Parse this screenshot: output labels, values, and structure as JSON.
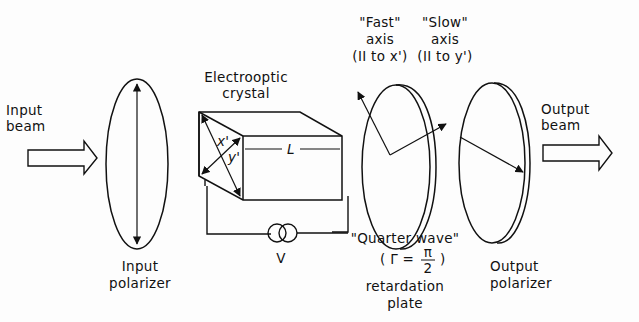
{
  "diagram": {
    "type": "electro-optic modulator schematic",
    "components": {
      "input_beam": {
        "line1": "Input",
        "line2": "beam"
      },
      "input_polarizer": {
        "line1": "Input",
        "line2": "polarizer"
      },
      "crystal": {
        "line1": "Electrooptic",
        "line2": "crystal",
        "length_label": "L",
        "axis_x": "x'",
        "axis_y": "y'"
      },
      "voltage": {
        "label": "V"
      },
      "fast_axis": {
        "line1": "\"Fast\"",
        "line2": "axis",
        "line3": "(II to x')"
      },
      "slow_axis": {
        "line1": "\"Slow\"",
        "line2": "axis",
        "line3": "(II to y')"
      },
      "quarter_wave": {
        "line1": "\"Quarter wave\"",
        "gamma_open": "( Γ =",
        "pi": "π",
        "two": "2",
        "gamma_close": ")",
        "line3": "retardation",
        "line4": "plate"
      },
      "output_polarizer": {
        "line1": "Output",
        "line2": "polarizer"
      },
      "output_beam": {
        "line1": "Output",
        "line2": "beam"
      }
    },
    "colors": {
      "ink": "#111111",
      "background": "#fdfdfd"
    }
  }
}
